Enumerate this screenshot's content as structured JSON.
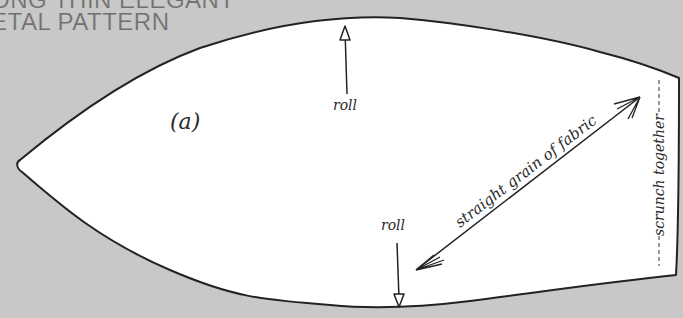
{
  "title": {
    "line1": "ONG THIN ELEGANT",
    "line2": "ETAL PATTERN"
  },
  "pattern_piece": {
    "label": "(a)",
    "annotations": {
      "roll_top": "roll",
      "roll_bottom": "roll",
      "grain": "straight grain of fabric",
      "scrunch": "scrunch together"
    }
  },
  "colors": {
    "background": "#c8c8c8",
    "piece_fill": "#ffffff",
    "outline": "#222222",
    "title_text": "#707070"
  }
}
